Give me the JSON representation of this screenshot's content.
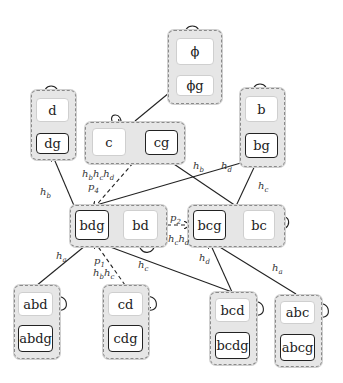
{
  "diagram": {
    "groups": [
      {
        "id": "phi",
        "nodes": [
          {
            "label": "ϕ",
            "bold": false
          },
          {
            "label": "ϕg",
            "bold": false
          }
        ]
      },
      {
        "id": "d",
        "nodes": [
          {
            "label": "d",
            "bold": false
          },
          {
            "label": "dg",
            "bold": true
          }
        ]
      },
      {
        "id": "c",
        "nodes": [
          {
            "label": "c",
            "bold": false
          },
          {
            "label": "cg",
            "bold": true
          }
        ]
      },
      {
        "id": "b",
        "nodes": [
          {
            "label": "b",
            "bold": false
          },
          {
            "label": "bg",
            "bold": true
          }
        ]
      },
      {
        "id": "bd",
        "nodes": [
          {
            "label": "bdg",
            "bold": true
          },
          {
            "label": "bd",
            "bold": false
          }
        ]
      },
      {
        "id": "bc",
        "nodes": [
          {
            "label": "bcg",
            "bold": true
          },
          {
            "label": "bc",
            "bold": false
          }
        ]
      },
      {
        "id": "abd",
        "nodes": [
          {
            "label": "abd",
            "bold": false
          },
          {
            "label": "abdg",
            "bold": true
          }
        ]
      },
      {
        "id": "cd",
        "nodes": [
          {
            "label": "cd",
            "bold": false
          },
          {
            "label": "cdg",
            "bold": true
          }
        ]
      },
      {
        "id": "bcd",
        "nodes": [
          {
            "label": "bcd",
            "bold": false
          },
          {
            "label": "bcdg",
            "bold": true
          }
        ]
      },
      {
        "id": "abc",
        "nodes": [
          {
            "label": "abc",
            "bold": false
          },
          {
            "label": "abcg",
            "bold": true
          }
        ]
      }
    ],
    "edge_labels": {
      "bdg_dg": {
        "base": "h",
        "sub": "b"
      },
      "bdg_bg": {
        "base": "h",
        "sub": "d"
      },
      "bcg_cg": {
        "base": "h",
        "sub": "b"
      },
      "bcg_bg": {
        "base": "h",
        "sub": "c"
      },
      "cg_bdg_p": {
        "base": "p",
        "sub": "4"
      },
      "cg_bdg_h": [
        {
          "base": "h",
          "sub": "b"
        },
        {
          "base": "h",
          "sub": "c"
        },
        {
          "base": "h",
          "sub": "d"
        }
      ],
      "bd_bcg_p": {
        "base": "p",
        "sub": "2"
      },
      "bd_bcg_h": [
        {
          "base": "h",
          "sub": "c"
        },
        {
          "base": "h",
          "sub": "d"
        }
      ],
      "abd_bdg": {
        "base": "h",
        "sub": "a"
      },
      "cd_bdg_p": {
        "base": "p",
        "sub": "1"
      },
      "cd_bdg_h": [
        {
          "base": "h",
          "sub": "b"
        },
        {
          "base": "h",
          "sub": "c"
        }
      ],
      "bcd_bdg": {
        "base": "h",
        "sub": "c"
      },
      "bcd_bcg": {
        "base": "h",
        "sub": "d"
      },
      "abc_bcg": {
        "base": "h",
        "sub": "a"
      }
    }
  }
}
